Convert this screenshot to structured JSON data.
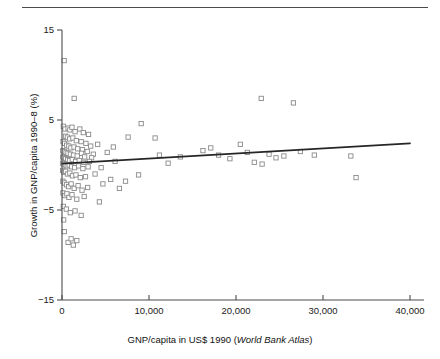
{
  "figure": {
    "name": "gnp-growth-scatter",
    "has_top_rule": true,
    "marker_style": "open-square",
    "marker_stroke": "#8a8a8a",
    "line_color": "#262626",
    "axis_color": "#4d4d4d"
  },
  "chart_data": {
    "type": "scatter",
    "title": "",
    "xlabel_plain": "GNP/capita in US$ 1990 (",
    "xlabel_italic": "World Bank Atlas",
    "xlabel_tail": ")",
    "ylabel": "Growth in GNP/capita 1990–8 (%)",
    "xlim": [
      0,
      40000
    ],
    "ylim": [
      -15,
      15
    ],
    "xticks": [
      0,
      10000,
      20000,
      30000,
      40000
    ],
    "xticklabels": [
      "0",
      "10,000",
      "20,000",
      "30,000",
      "40,000"
    ],
    "yticks": [
      15,
      5,
      -5,
      -15
    ],
    "yticklabels": [
      "15",
      "5",
      "−5",
      "−15"
    ],
    "grid": false,
    "legend": null,
    "series": [
      {
        "name": "Countries",
        "marker": "open-square",
        "points": [
          [
            250,
            11.6
          ],
          [
            1400,
            7.4
          ],
          [
            9100,
            4.6
          ],
          [
            22900,
            7.4
          ],
          [
            26600,
            6.9
          ],
          [
            150,
            4.3
          ],
          [
            350,
            4.0
          ],
          [
            700,
            4.1
          ],
          [
            900,
            3.9
          ],
          [
            1150,
            4.2
          ],
          [
            1500,
            3.7
          ],
          [
            2050,
            4.0
          ],
          [
            2450,
            3.6
          ],
          [
            3050,
            3.4
          ],
          [
            10700,
            3.0
          ],
          [
            400,
            3.2
          ],
          [
            620,
            3.1
          ],
          [
            880,
            2.9
          ],
          [
            1250,
            3.0
          ],
          [
            1650,
            2.7
          ],
          [
            2200,
            2.6
          ],
          [
            2750,
            2.4
          ],
          [
            3300,
            2.1
          ],
          [
            4100,
            2.3
          ],
          [
            5200,
            1.4
          ],
          [
            120,
            2.6
          ],
          [
            300,
            2.4
          ],
          [
            540,
            2.2
          ],
          [
            780,
            2.1
          ],
          [
            1020,
            1.9
          ],
          [
            1380,
            2.0
          ],
          [
            1800,
            1.8
          ],
          [
            2350,
            1.7
          ],
          [
            2900,
            1.5
          ],
          [
            3600,
            1.2
          ],
          [
            90,
            1.6
          ],
          [
            260,
            1.5
          ],
          [
            470,
            1.4
          ],
          [
            690,
            1.3
          ],
          [
            960,
            1.2
          ],
          [
            1320,
            1.1
          ],
          [
            1750,
            1.0
          ],
          [
            2250,
            1.3
          ],
          [
            2600,
            0.9
          ],
          [
            3400,
            0.8
          ],
          [
            80,
            0.9
          ],
          [
            220,
            0.8
          ],
          [
            430,
            0.7
          ],
          [
            640,
            0.6
          ],
          [
            860,
            0.5
          ],
          [
            1180,
            0.6
          ],
          [
            1560,
            0.4
          ],
          [
            1980,
            0.5
          ],
          [
            2500,
            0.3
          ],
          [
            3150,
            0.4
          ],
          [
            60,
            0.2
          ],
          [
            200,
            0.1
          ],
          [
            390,
            0.0
          ],
          [
            600,
            -0.1
          ],
          [
            820,
            0.0
          ],
          [
            1100,
            -0.2
          ],
          [
            1450,
            -0.3
          ],
          [
            1900,
            -0.1
          ],
          [
            2400,
            -0.4
          ],
          [
            3000,
            -0.2
          ],
          [
            70,
            -0.6
          ],
          [
            210,
            -0.8
          ],
          [
            410,
            -0.7
          ],
          [
            630,
            -1.0
          ],
          [
            900,
            -0.9
          ],
          [
            1200,
            -1.2
          ],
          [
            1600,
            -1.1
          ],
          [
            2100,
            -1.4
          ],
          [
            2700,
            -1.3
          ],
          [
            3800,
            -1.0
          ],
          [
            5600,
            -1.6
          ],
          [
            4700,
            -2.1
          ],
          [
            6600,
            -2.6
          ],
          [
            100,
            -1.8
          ],
          [
            280,
            -2.0
          ],
          [
            520,
            -2.2
          ],
          [
            760,
            -2.4
          ],
          [
            1050,
            -2.1
          ],
          [
            1400,
            -2.6
          ],
          [
            1850,
            -2.3
          ],
          [
            2300,
            -2.8
          ],
          [
            2950,
            -2.5
          ],
          [
            110,
            -3.1
          ],
          [
            330,
            -3.4
          ],
          [
            560,
            -3.2
          ],
          [
            800,
            -3.6
          ],
          [
            1150,
            -3.3
          ],
          [
            1700,
            -3.8
          ],
          [
            2550,
            -3.5
          ],
          [
            4300,
            -4.1
          ],
          [
            150,
            -4.6
          ],
          [
            500,
            -4.9
          ],
          [
            950,
            -5.3
          ],
          [
            1500,
            -5.1
          ],
          [
            2200,
            -5.6
          ],
          [
            190,
            -6.1
          ],
          [
            260,
            -7.4
          ],
          [
            700,
            -8.6
          ],
          [
            1050,
            -8.2
          ],
          [
            1300,
            -8.9
          ],
          [
            1700,
            -8.4
          ],
          [
            13600,
            0.9
          ],
          [
            16200,
            1.6
          ],
          [
            17100,
            1.9
          ],
          [
            18000,
            1.1
          ],
          [
            19300,
            0.7
          ],
          [
            20500,
            2.3
          ],
          [
            21300,
            1.4
          ],
          [
            22100,
            0.3
          ],
          [
            23000,
            0.1
          ],
          [
            23800,
            1.2
          ],
          [
            24600,
            0.8
          ],
          [
            25500,
            1.0
          ],
          [
            27400,
            1.5
          ],
          [
            29000,
            1.1
          ],
          [
            33200,
            1.0
          ],
          [
            33800,
            -1.4
          ],
          [
            12200,
            0.2
          ],
          [
            7600,
            3.1
          ],
          [
            7300,
            -1.8
          ],
          [
            8800,
            -1.1
          ],
          [
            6100,
            0.4
          ],
          [
            4500,
            -0.3
          ],
          [
            5900,
            2.0
          ],
          [
            11200,
            1.1
          ]
        ]
      }
    ],
    "trendline": {
      "name": "linear-fit",
      "x": [
        0,
        40000
      ],
      "y": [
        0.15,
        2.4
      ]
    }
  }
}
